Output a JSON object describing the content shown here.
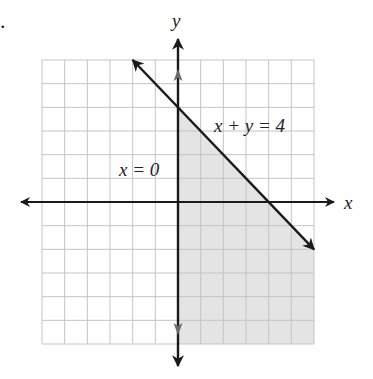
{
  "problem_marker": ".",
  "chart_data": {
    "type": "line",
    "title": "",
    "xlabel": "x",
    "ylabel": "y",
    "xlim": [
      -6,
      6
    ],
    "ylim": [
      -6,
      6
    ],
    "grid": true,
    "grid_step": 1,
    "lines": [
      {
        "name": "x + y = 4",
        "label": "x + y = 4",
        "points": [
          [
            -2,
            6
          ],
          [
            6,
            -2
          ]
        ],
        "arrows": "both",
        "label_position": [
          1.6,
          3.1
        ]
      },
      {
        "name": "x = 0",
        "label": "x = 0",
        "points": [
          [
            0,
            6
          ],
          [
            0,
            -6
          ]
        ],
        "arrows": "both",
        "label_position": [
          -2.6,
          1.2
        ]
      }
    ],
    "shaded_region": {
      "description": "x >= 0 and x + y <= 4",
      "vertices": [
        [
          0,
          4
        ],
        [
          0,
          -6
        ],
        [
          6,
          -6
        ],
        [
          6,
          -2
        ]
      ],
      "color": "#e4e4e4"
    },
    "colors": {
      "grid": "#c4c4c4",
      "axis": "#1a1a1a",
      "shade": "#e4e4e4",
      "line": "#1a1a1a",
      "secondary_arrow": "#6a6a6a"
    }
  }
}
